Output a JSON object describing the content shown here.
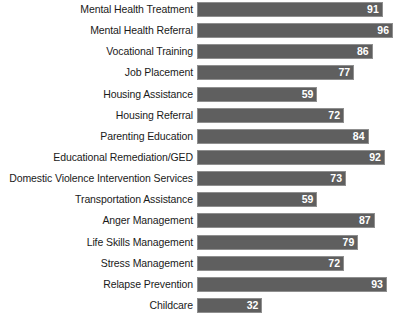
{
  "chart_data": {
    "type": "bar",
    "orientation": "horizontal",
    "title": "",
    "subtitle": "",
    "xlabel": "",
    "ylabel": "",
    "xlim": [
      0,
      96
    ],
    "grid": false,
    "legend": null,
    "value_labels": true,
    "bar_color": "#5f5f5f",
    "bar_border_color": "#8f8f8f",
    "value_label_color": "#ffffff",
    "label_color": "#1a1a1a",
    "background_color": "#ffffff",
    "categories": [
      "Mental Health Treatment",
      "Mental Health Referral",
      "Vocational Training",
      "Job Placement",
      "Housing Assistance",
      "Housing Referral",
      "Parenting Education",
      "Educational Remediation/GED",
      "Domestic Violence Intervention Services",
      "Transportation Assistance",
      "Anger Management",
      "Life Skills Management",
      "Stress Management",
      "Relapse Prevention",
      "Childcare"
    ],
    "values": [
      91,
      96,
      86,
      77,
      59,
      72,
      84,
      92,
      73,
      59,
      87,
      79,
      72,
      93,
      32
    ]
  }
}
